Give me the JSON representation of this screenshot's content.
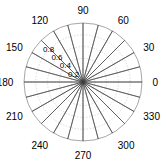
{
  "figure": {
    "type": "polar-plot",
    "background_color": "#ffffff",
    "center_x": 83,
    "center_y": 82,
    "outer_radius": 59
  },
  "chart_data": {
    "type": "line",
    "plot_style": "polar",
    "title": "",
    "xlabel": "",
    "ylabel": "",
    "rlim": [
      0,
      1
    ],
    "grid": true,
    "legend": null,
    "angle_unit": "degrees",
    "angle_tick_labels": [
      "0",
      "30",
      "60",
      "90",
      "120",
      "150",
      "180",
      "210",
      "240",
      "270",
      "300",
      "330"
    ],
    "angle_ticks": [
      0,
      30,
      60,
      90,
      120,
      150,
      180,
      210,
      240,
      270,
      300,
      330
    ],
    "radial_tick_labels": [
      "0.2",
      "0.4",
      "0.6",
      "0.8"
    ],
    "radial_ticks": [
      0.2,
      0.4,
      0.6,
      0.8
    ],
    "radial_label_angle": 135,
    "series": [
      {
        "name": "petal-star",
        "description": "24 narrow radial petals reaching r=1",
        "petal_count": 24,
        "petal_half_width_deg": 5,
        "theta": [
          0,
          5,
          10,
          15,
          20,
          25,
          30,
          35,
          40,
          45,
          50,
          55,
          60,
          65,
          70,
          75,
          80,
          85,
          90,
          95,
          100,
          105,
          110,
          115,
          120,
          125,
          130,
          135,
          140,
          145,
          150,
          155,
          160,
          165,
          170,
          175,
          180,
          185,
          190,
          195,
          200,
          205,
          210,
          215,
          220,
          225,
          230,
          235,
          240,
          245,
          250,
          255,
          260,
          265,
          270,
          275,
          280,
          285,
          290,
          295,
          300,
          305,
          310,
          315,
          320,
          325,
          330,
          335,
          340,
          345,
          350,
          355
        ],
        "r": [
          1,
          0,
          0,
          1,
          0,
          0,
          1,
          0,
          0,
          1,
          0,
          0,
          1,
          0,
          0,
          1,
          0,
          0,
          1,
          0,
          0,
          1,
          0,
          0,
          1,
          0,
          0,
          1,
          0,
          0,
          1,
          0,
          0,
          1,
          0,
          0,
          1,
          0,
          0,
          1,
          0,
          0,
          1,
          0,
          0,
          1,
          0,
          0,
          1,
          0,
          0,
          1,
          0,
          0,
          1,
          0,
          0,
          1,
          0,
          0,
          1,
          0,
          0,
          1,
          0,
          0,
          1,
          0,
          0,
          1,
          0,
          0
        ],
        "line_color": "#404040",
        "line_width": 0.6
      }
    ],
    "grid_color": "#b8b8b8",
    "axis_color": "#808080"
  }
}
